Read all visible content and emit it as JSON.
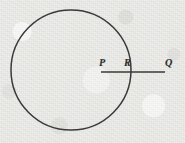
{
  "figure": {
    "background_color": "#ebebe8",
    "ink_color": "#3a3a3a",
    "label_color": "#2e2e2e",
    "circle": {
      "name": "circle",
      "center_x": 71,
      "center_y": 70,
      "radius": 60,
      "stroke_width": 1.5
    },
    "segment": {
      "name": "segment-pq",
      "x1": 101,
      "y1": 72,
      "x2": 165,
      "y2": 72,
      "stroke_width": 1.6
    },
    "labels": [
      {
        "id": "point-p",
        "text": "P",
        "x": 99,
        "y": 58
      },
      {
        "id": "point-r",
        "text": "R",
        "x": 124,
        "y": 58
      },
      {
        "id": "point-q",
        "text": "Q",
        "x": 165,
        "y": 58
      }
    ]
  }
}
